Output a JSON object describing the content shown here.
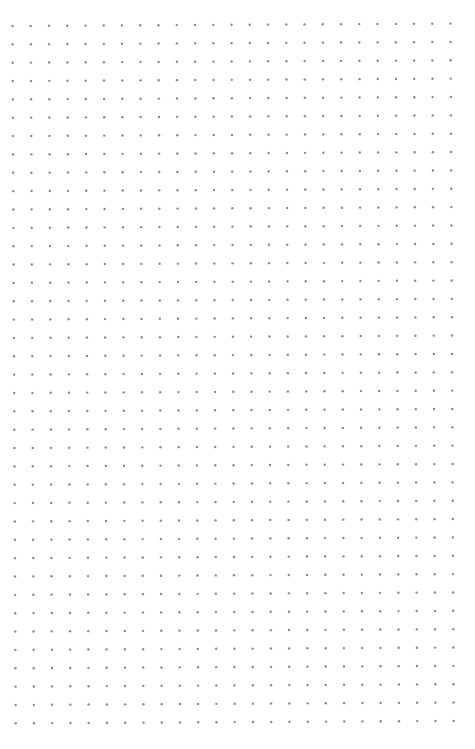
{
  "page": {
    "type": "dot-grid-paper",
    "background": "#ffffff",
    "dot_color": "#8a8a8a",
    "dot_radius": 1.2
  },
  "grid": {
    "columns": 25,
    "rows": 39,
    "origin_x": 12.5,
    "origin_y": 26,
    "spacing_x": 18.25,
    "spacing_y": 18.35,
    "skew_x_per_row": 0.085,
    "skew_y_per_col": -0.1
  }
}
